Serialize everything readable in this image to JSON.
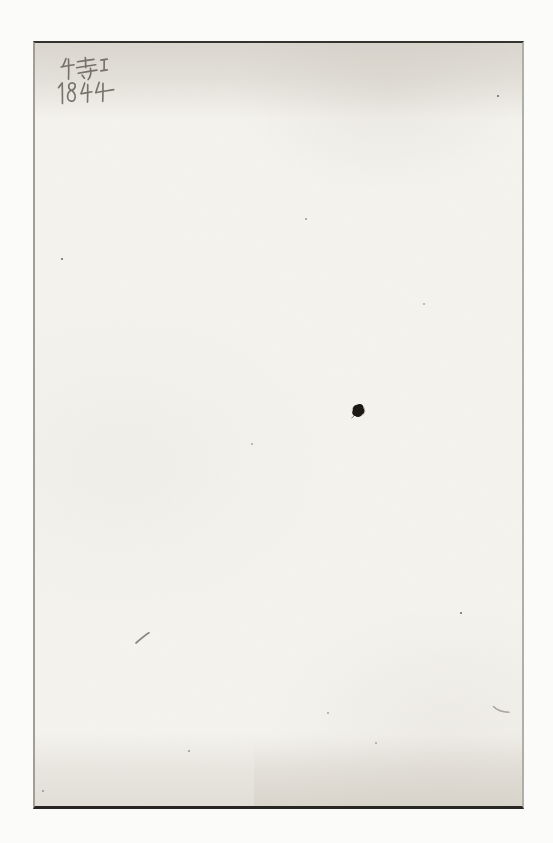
{
  "scan": {
    "description": "Blank scanned book flyleaf page",
    "background_color": "#fbfbf9",
    "paper_color": "#f6f4ef",
    "top_band_color": "#e7e4dd",
    "bottom_band_color": "#eae7e0",
    "edge_colors": {
      "top": "#35332e",
      "bottom": "#282622",
      "left": "#a19e97",
      "right": "#b1aea7"
    }
  },
  "inscription": {
    "line1": "特1",
    "line2": "1844",
    "medium": "pencil",
    "color": "#67645c"
  },
  "marks": {
    "ink_blot_color": "#17130f",
    "pencil_slash_color": "#6f6d66",
    "pencil_tick_color": "#8e8c86"
  }
}
